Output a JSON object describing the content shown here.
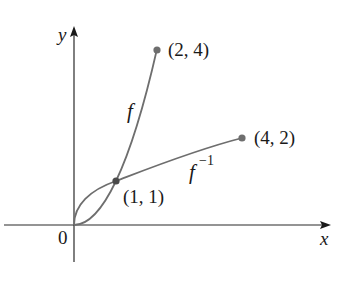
{
  "figure": {
    "axes": {
      "x_label": "x",
      "y_label": "y",
      "origin_label": "0",
      "axis_color": "#2b2b2b"
    },
    "curves": [
      {
        "name": "f",
        "label": "f",
        "formula": "y = x^2",
        "domain": [
          0,
          2
        ],
        "color": "#6e6e6e"
      },
      {
        "name": "f_inverse",
        "label": "f",
        "label_superscript": "−1",
        "formula": "y = sqrt(x)",
        "domain": [
          0,
          4
        ],
        "color": "#6e6e6e"
      }
    ],
    "points": [
      {
        "label": "(2, 4)",
        "x": 2,
        "y": 4
      },
      {
        "label": "(4, 2)",
        "x": 4,
        "y": 2
      },
      {
        "label": "(1, 1)",
        "x": 1,
        "y": 1
      }
    ],
    "point_color": "#6e6e6e"
  }
}
